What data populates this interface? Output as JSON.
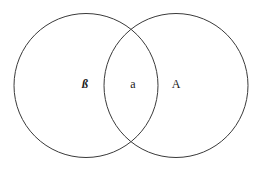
{
  "diagram": {
    "type": "venn",
    "stroke_color": "#3a3a3a",
    "background": "#ffffff",
    "circles": [
      {
        "name": "left-set",
        "cx": 86,
        "cy": 85.5,
        "r": 72
      },
      {
        "name": "right-set",
        "cx": 176,
        "cy": 85.5,
        "r": 72
      }
    ],
    "regions": {
      "left_only": {
        "label": "ß"
      },
      "intersection": {
        "label": "a"
      },
      "right_only": {
        "label": "A"
      }
    }
  }
}
